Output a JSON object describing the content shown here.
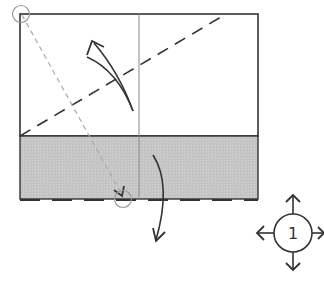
{
  "diagram": {
    "type": "origami-fold-diagram",
    "colors": {
      "paper_front": "#ffffff",
      "paper_back": "#c8c8c8",
      "outline": "#333333",
      "crease": "#888888",
      "guide_dashed": "#aaaaaa"
    },
    "step_symbol": {
      "label": "1",
      "meaning": "repeat / rotate in all directions"
    }
  }
}
